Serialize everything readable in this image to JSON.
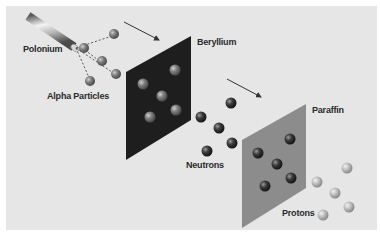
{
  "diagram": {
    "labels": {
      "polonium": "Polonium",
      "alpha_particles": "Alpha Particles",
      "beryllium": "Beryllium",
      "neutrons": "Neutrons",
      "paraffin": "Paraffin",
      "protons": "Protons"
    },
    "colors": {
      "background": "#e6e6e6",
      "beryllium_plate": "#1e1e1e",
      "paraffin_plate": "#8c8c8c",
      "alpha_particle": "#7a7a7a",
      "neutron": "#3a3a3a",
      "proton": "#b8b8b8",
      "arrow": "#333333"
    },
    "stages": [
      {
        "source": "Polonium",
        "emits": "Alpha Particles"
      },
      {
        "target": "Beryllium",
        "emits": "Neutrons"
      },
      {
        "target": "Paraffin",
        "emits": "Protons"
      }
    ]
  }
}
